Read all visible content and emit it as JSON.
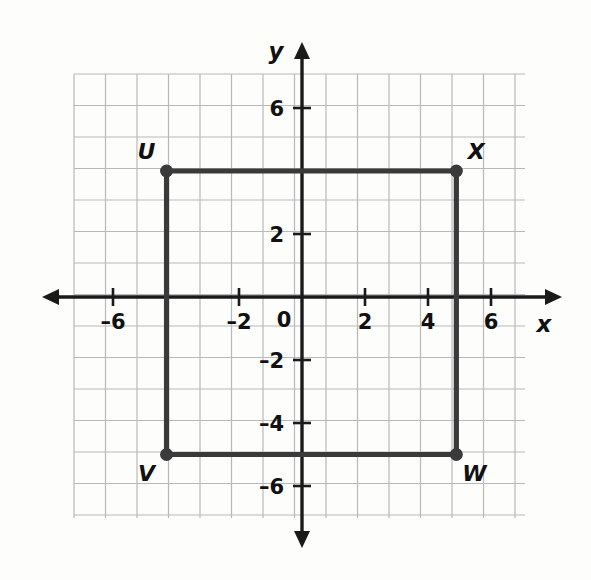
{
  "figure": {
    "background_color": "#fdfdfc",
    "grid_color": "#b9b9bb",
    "axis_color": "#1a1a1a",
    "shape_color": "#3a3a3a"
  },
  "axes": {
    "x_axis_label": "x",
    "y_axis_label": "y",
    "origin_label": "0",
    "x_tick_labels": [
      "–6",
      "–2",
      "2",
      "4",
      "6"
    ],
    "x_tick_values": [
      -6,
      -2,
      2,
      4,
      6
    ],
    "y_tick_labels": [
      "6",
      "2",
      "–2",
      "–4",
      "–6"
    ],
    "y_tick_values": [
      6,
      2,
      -2,
      -4,
      -6
    ],
    "x_range": [
      -7.6,
      7.4
    ],
    "y_range": [
      -7.4,
      7.4
    ],
    "grid_step": 1,
    "grid_visible": true,
    "arrows": [
      "left",
      "right",
      "up",
      "down"
    ]
  },
  "chart_data": {
    "type": "scatter",
    "title": "",
    "xlabel": "x",
    "ylabel": "y",
    "xlim": [
      -7.6,
      7.4
    ],
    "ylim": [
      -7.4,
      7.4
    ],
    "grid": true,
    "legend": "none",
    "shapes": [
      {
        "name": "rectangle-UVWX",
        "closed": true,
        "vertices": [
          {
            "label": "U",
            "x": -4.3,
            "y": 4.0,
            "label_position": "above-left"
          },
          {
            "label": "X",
            "x": 4.9,
            "y": 4.0,
            "label_position": "above-right"
          },
          {
            "label": "W",
            "x": 4.9,
            "y": -5.0,
            "label_position": "below-right"
          },
          {
            "label": "V",
            "x": -4.3,
            "y": -5.0,
            "label_position": "below-left"
          }
        ]
      }
    ],
    "annotations": [
      {
        "text": "U",
        "x": -4.3,
        "y": 4.0
      },
      {
        "text": "X",
        "x": 4.9,
        "y": 4.0
      },
      {
        "text": "W",
        "x": 4.9,
        "y": -5.0
      },
      {
        "text": "V",
        "x": -4.3,
        "y": -5.0
      }
    ]
  }
}
